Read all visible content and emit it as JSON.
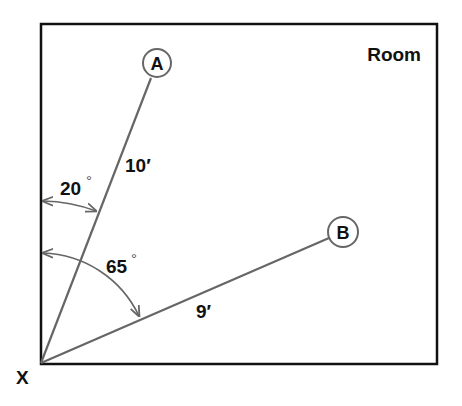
{
  "diagram": {
    "room_label": "Room",
    "origin_label": "X",
    "points": [
      {
        "id": "A",
        "label": "A",
        "distance_label": "10′",
        "angle_label": "20",
        "angle_unit": "°"
      },
      {
        "id": "B",
        "label": "B",
        "distance_label": "9′",
        "angle_label": "65",
        "angle_unit": "°"
      }
    ],
    "colors": {
      "room_border": "#111111",
      "ray_lines": "#666666",
      "arcs": "#666666",
      "text": "#111111"
    }
  }
}
